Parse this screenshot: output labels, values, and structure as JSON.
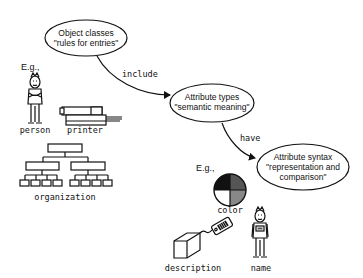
{
  "diagram": {
    "nodes": [
      {
        "id": "object-classes",
        "line1": "Object classes",
        "line2": "\"rules for entries\""
      },
      {
        "id": "attribute-types",
        "line1": "Attribute types",
        "line2": "\"semantic meaning\""
      },
      {
        "id": "attribute-syntax",
        "line1": "Attribute syntax",
        "line2": "\"representation and",
        "line3": "comparison\""
      }
    ],
    "edges": [
      {
        "from": "object-classes",
        "to": "attribute-types",
        "label": "include"
      },
      {
        "from": "attribute-types",
        "to": "attribute-syntax",
        "label": "have"
      }
    ],
    "examples_objects": {
      "eg_label": "E.g.,",
      "items": [
        "person",
        "printer",
        "organization"
      ]
    },
    "examples_attributes": {
      "eg_label": "E.g.,",
      "items": [
        "color",
        "description",
        "name"
      ]
    },
    "colors": {
      "pie_quadrants": [
        "#111111",
        "#555555",
        "#ffffff",
        "#888888"
      ]
    }
  }
}
